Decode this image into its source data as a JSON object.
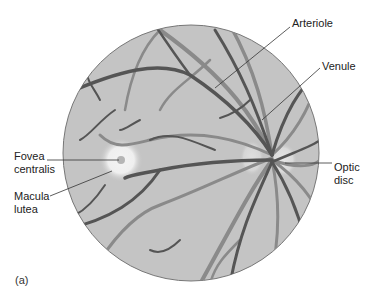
{
  "figure": {
    "panel_label": "(a)",
    "colors": {
      "fundus_fill": "#c4c4c4",
      "vessel_dark": "#555555",
      "vessel_light": "#8a8a8a",
      "outline": "#777777",
      "text": "#222222"
    }
  },
  "labels": {
    "arteriole": "Arteriole",
    "venule": "Venule",
    "optic_disc": "Optic\ndisc",
    "fovea_centralis": "Fovea\ncentralis",
    "macula_lutea": "Macula\nlutea"
  }
}
